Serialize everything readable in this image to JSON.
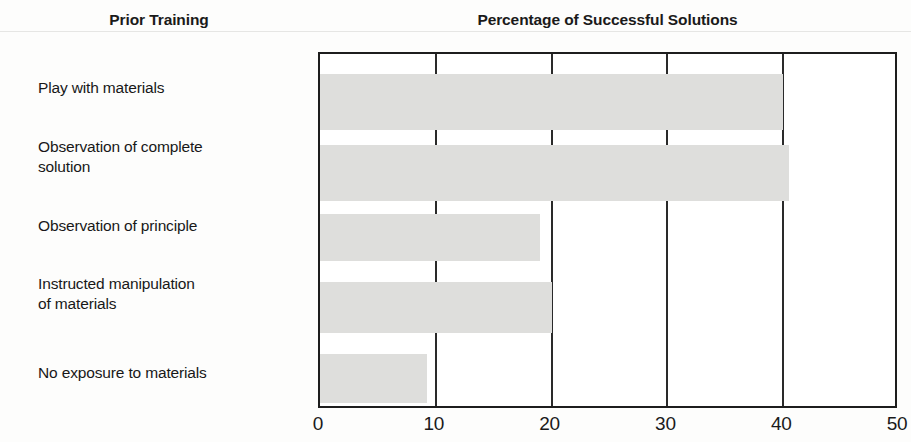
{
  "artifacts": {
    "top_fragment": "",
    "rule": "horizontal-rule"
  },
  "headers": {
    "category_column": "Prior Training",
    "chart_title": "Percentage of Successful Solutions"
  },
  "colors": {
    "bar_fill": "#dededc",
    "axis": "#1d1d1d",
    "text": "#1a1a1a",
    "background": "#fdfdfc"
  },
  "chart_data": {
    "type": "bar",
    "orientation": "horizontal",
    "title": "Percentage of Successful Solutions",
    "subtitle": "",
    "xlabel": "",
    "ylabel": "Prior Training",
    "categories": [
      "Play with materials",
      "Observation of complete solution",
      "Observation of principle",
      "Instructed manipulation of materials",
      "No exposure to materials"
    ],
    "category_display": [
      "Play with materials",
      "Observation of complete\nsolution",
      "Observation of principle",
      "Instructed manipulation\nof materials",
      "No exposure to materials"
    ],
    "values": [
      40,
      40.5,
      19,
      20,
      9.2
    ],
    "xlim": [
      0,
      50
    ],
    "xticks": [
      0,
      10,
      20,
      30,
      40,
      50
    ],
    "xtick_labels": [
      "0",
      "10",
      "20",
      "30",
      "40",
      "50"
    ],
    "grid": true,
    "grid_axis": "x",
    "legend": false,
    "legend_position": "none"
  }
}
